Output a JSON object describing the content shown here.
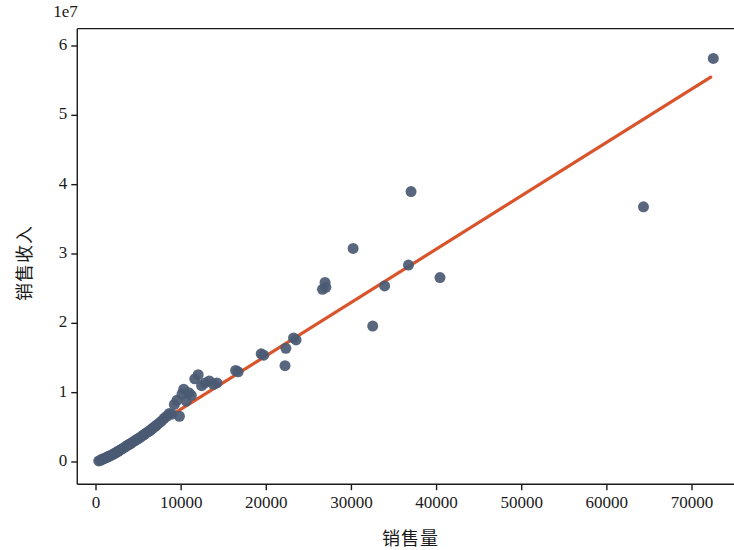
{
  "figure": {
    "background": "#ffffff",
    "axes_color": "#1a1a1a",
    "marker_color": "#4a5a73",
    "line_color": "#d9542b"
  },
  "chart_data": {
    "type": "scatter",
    "title": "",
    "xlabel": "销售量",
    "ylabel": "销售收入",
    "y_offset_text": "1e7",
    "y_offset_multiplier": 10000000,
    "xlim": [
      -2200,
      76000
    ],
    "ylim": [
      -3200000,
      62500000
    ],
    "xticks": [
      0,
      10000,
      20000,
      30000,
      40000,
      50000,
      60000,
      70000
    ],
    "xtick_labels": [
      "0",
      "10000",
      "20000",
      "30000",
      "40000",
      "50000",
      "60000",
      "70000"
    ],
    "yticks": [
      0,
      10000000,
      20000000,
      30000000,
      40000000,
      50000000,
      60000000
    ],
    "ytick_labels": [
      "0",
      "1",
      "2",
      "3",
      "4",
      "5",
      "6"
    ],
    "grid": false,
    "legend": null,
    "marker_size": 11,
    "series": [
      {
        "name": "销售数据",
        "type": "scatter",
        "color": "#4a5a73",
        "x": [
          320,
          520,
          700,
          850,
          980,
          1150,
          1300,
          1420,
          1580,
          1750,
          1900,
          2050,
          2250,
          2400,
          2600,
          2800,
          3000,
          3200,
          3450,
          3700,
          3900,
          4100,
          4350,
          4600,
          4800,
          5000,
          5250,
          5500,
          5700,
          5900,
          6100,
          6300,
          6500,
          6700,
          6900,
          7100,
          7400,
          7700,
          8000,
          8300,
          8600,
          8900,
          9200,
          9500,
          9800,
          10100,
          10300,
          10600,
          10900,
          11200,
          11600,
          12000,
          12400,
          12800,
          13300,
          13800,
          14200,
          16400,
          16700,
          19400,
          19700,
          22200,
          22300,
          23200,
          23500,
          26600,
          26900,
          27000,
          30200,
          32500,
          33900,
          36700,
          37000,
          40400,
          64300,
          72500
        ],
        "y": [
          150000,
          250000,
          380000,
          450000,
          520000,
          600000,
          700000,
          780000,
          850000,
          950000,
          1050000,
          1150000,
          1300000,
          1400000,
          1550000,
          1700000,
          1850000,
          2000000,
          2200000,
          2400000,
          2550000,
          2700000,
          2900000,
          3100000,
          3250000,
          3400000,
          3600000,
          3850000,
          4000000,
          4200000,
          4350000,
          4500000,
          4700000,
          4900000,
          5100000,
          5300000,
          5600000,
          5900000,
          6300000,
          6600000,
          7000000,
          6900000,
          8300000,
          8900000,
          6600000,
          9800000,
          10500000,
          8800000,
          10000000,
          9600000,
          12000000,
          12600000,
          11000000,
          11400000,
          11700000,
          11200000,
          11400000,
          13200000,
          13000000,
          15600000,
          15400000,
          13900000,
          16400000,
          17900000,
          17600000,
          24900000,
          25900000,
          25200000,
          30800000,
          19600000,
          25400000,
          28400000,
          39000000,
          26600000,
          36800000,
          58200000
        ]
      },
      {
        "name": "回归线",
        "type": "line",
        "color": "#d9542b",
        "x": [
          700,
          72200
        ],
        "y": [
          500000,
          55500000
        ]
      }
    ]
  }
}
